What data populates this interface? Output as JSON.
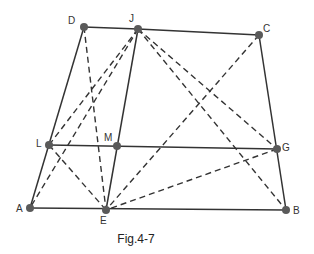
{
  "figure": {
    "caption": "Fig.4-7",
    "points": [
      {
        "id": "D",
        "x": 84,
        "y": 27,
        "label": "D",
        "lx": 68,
        "ly": 16
      },
      {
        "id": "J",
        "x": 138,
        "y": 29,
        "label": "J",
        "lx": 129,
        "ly": 14
      },
      {
        "id": "C",
        "x": 259,
        "y": 35,
        "label": "C",
        "lx": 263,
        "ly": 24
      },
      {
        "id": "L",
        "x": 49,
        "y": 145,
        "label": "L",
        "lx": 36,
        "ly": 139
      },
      {
        "id": "M",
        "x": 117,
        "y": 146,
        "label": "M",
        "lx": 104,
        "ly": 133
      },
      {
        "id": "G",
        "x": 277,
        "y": 149,
        "label": "G",
        "lx": 282,
        "ly": 143
      },
      {
        "id": "A",
        "x": 30,
        "y": 208,
        "label": "A",
        "lx": 16,
        "ly": 204
      },
      {
        "id": "E",
        "x": 106,
        "y": 210,
        "label": "E",
        "lx": 100,
        "ly": 216
      },
      {
        "id": "B",
        "x": 286,
        "y": 210,
        "label": "B",
        "lx": 293,
        "ly": 206
      }
    ],
    "solid_segments": [
      [
        "D",
        "J"
      ],
      [
        "J",
        "C"
      ],
      [
        "D",
        "A"
      ],
      [
        "C",
        "B"
      ],
      [
        "A",
        "B"
      ],
      [
        "L",
        "G"
      ],
      [
        "J",
        "E"
      ]
    ],
    "dashed_segments": [
      [
        "D",
        "E"
      ],
      [
        "J",
        "L"
      ],
      [
        "J",
        "A"
      ],
      [
        "J",
        "G"
      ],
      [
        "J",
        "B"
      ],
      [
        "C",
        "E"
      ],
      [
        "G",
        "E"
      ],
      [
        "L",
        "E"
      ]
    ],
    "colors": {
      "line": "#333333",
      "point": "#5a5a5a",
      "text": "#222222"
    }
  }
}
